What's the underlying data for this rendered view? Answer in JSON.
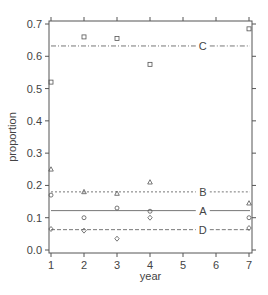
{
  "chart_data": {
    "type": "scatter",
    "title": "",
    "xlabel": "year",
    "ylabel": "proportion",
    "xlim": [
      1,
      7
    ],
    "ylim": [
      0.0,
      0.7
    ],
    "xticks": [
      "1",
      "2",
      "3",
      "4",
      "5",
      "6",
      "7"
    ],
    "yticks": [
      "0.0",
      "0.1",
      "0.2",
      "0.3",
      "0.4",
      "0.5",
      "0.6",
      "0.7"
    ],
    "grid": false,
    "series": [
      {
        "name": "C",
        "marker": "square",
        "points": [
          [
            1,
            0.52
          ],
          [
            2,
            0.66
          ],
          [
            3,
            0.655
          ],
          [
            4,
            0.575
          ],
          [
            7,
            0.685
          ]
        ],
        "mean": 0.632,
        "line_style": "dashdot",
        "label_x": 5.6
      },
      {
        "name": "B",
        "marker": "triangle",
        "points": [
          [
            1,
            0.25
          ],
          [
            2,
            0.18
          ],
          [
            3,
            0.175
          ],
          [
            4,
            0.21
          ],
          [
            7,
            0.145
          ]
        ],
        "mean": 0.18,
        "line_style": "dotted",
        "label_x": 5.6
      },
      {
        "name": "A",
        "marker": "circle",
        "points": [
          [
            1,
            0.17
          ],
          [
            2,
            0.1
          ],
          [
            3,
            0.13
          ],
          [
            4,
            0.12
          ],
          [
            7,
            0.1
          ]
        ],
        "mean": 0.122,
        "line_style": "solid",
        "label_x": 5.6
      },
      {
        "name": "D",
        "marker": "diamond",
        "points": [
          [
            1,
            0.065
          ],
          [
            2,
            0.06
          ],
          [
            3,
            0.035
          ],
          [
            4,
            0.1
          ],
          [
            7,
            0.068
          ]
        ],
        "mean": 0.063,
        "line_style": "dashed",
        "label_x": 5.6
      }
    ]
  }
}
